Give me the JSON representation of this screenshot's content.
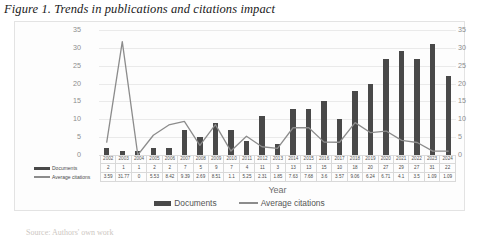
{
  "figure": {
    "title": "Figure 1. Trends in publications and citations impact",
    "source_note": "Source: Authors' own work"
  },
  "axis": {
    "x_title": "Year"
  },
  "legend": {
    "items": [
      {
        "label": "Documents",
        "marker": "bar-swatch",
        "color": "#494949"
      },
      {
        "label": "Average citations",
        "marker": "line-swatch",
        "color": "#8c8c8c"
      }
    ]
  },
  "table": {
    "row_labels": [
      "Documents",
      "Average citations"
    ]
  },
  "chart_data": {
    "type": "bar",
    "title": "Trends in publications and citations impact",
    "xlabel": "Year",
    "ylabel": "",
    "ylim": [
      0,
      35
    ],
    "y2lim": [
      0,
      35
    ],
    "yticks": [
      0,
      5,
      10,
      15,
      20,
      25,
      30,
      35
    ],
    "y2ticks": [
      0,
      5,
      10,
      15,
      20,
      25,
      30,
      35
    ],
    "grid": true,
    "legend_position": "bottom",
    "categories": [
      "2002",
      "2003",
      "2004",
      "2005",
      "2006",
      "2007",
      "2008",
      "2009",
      "2010",
      "2011",
      "2012",
      "2013",
      "2014",
      "2015",
      "2016",
      "2017",
      "2018",
      "2019",
      "2020",
      "2021",
      "2022",
      "2023",
      "2024"
    ],
    "series": [
      {
        "name": "Documents",
        "type": "bar",
        "axis": "left",
        "color": "#494949",
        "values": [
          2,
          1,
          1,
          2,
          2,
          7,
          5,
          9,
          7,
          4,
          11,
          3,
          13,
          13,
          15,
          10,
          18,
          20,
          27,
          29,
          27,
          31,
          22
        ]
      },
      {
        "name": "Average citations",
        "type": "line",
        "axis": "right",
        "color": "#8c8c8c",
        "values": [
          3.59,
          31.77,
          0,
          5.53,
          8.42,
          9.39,
          2.69,
          8.51,
          1.1,
          5.25,
          2.31,
          1.85,
          7.63,
          7.68,
          3.6,
          3.57,
          9.06,
          6.24,
          6.71,
          4.1,
          3.5,
          1.09,
          1.09
        ]
      }
    ]
  }
}
